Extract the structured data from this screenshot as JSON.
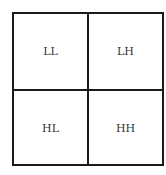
{
  "diagram": {
    "title": "",
    "cells": [
      {
        "label": "LL",
        "row": 0,
        "col": 0
      },
      {
        "label": "LH",
        "row": 0,
        "col": 1
      },
      {
        "label": "HL",
        "row": 1,
        "col": 0
      },
      {
        "label": "HH",
        "row": 1,
        "col": 1
      }
    ],
    "colors": {
      "line": "#1a1a1a",
      "text": "#333333",
      "background": "#ffffff"
    }
  }
}
